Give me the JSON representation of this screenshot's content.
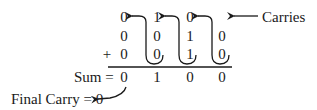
{
  "diagram": {
    "carries_label": "Carries",
    "plus_sign": "+",
    "sum_label": "Sum =",
    "final_carry_label": "Final Carry = 0",
    "rows": {
      "carries": [
        "0",
        "1",
        "0",
        ""
      ],
      "operand_a": [
        "0",
        "0",
        "1",
        "0"
      ],
      "operand_b": [
        "0",
        "0",
        "1",
        "0"
      ],
      "sum": [
        "0",
        "1",
        "0",
        "0"
      ]
    },
    "final_carry": "0",
    "colors": {
      "ink": "#1a1a1a",
      "background": "#ffffff"
    }
  }
}
